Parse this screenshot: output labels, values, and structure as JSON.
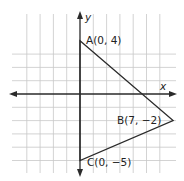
{
  "diagram": {
    "type": "coordinate-plane",
    "axes": {
      "x_label": "x",
      "y_label": "y"
    },
    "grid": {
      "x_min": -5,
      "x_max": 7,
      "y_min": -5,
      "y_max": 4
    },
    "points": [
      {
        "name": "A",
        "x": 0,
        "y": 4,
        "label": "A(0, 4)"
      },
      {
        "name": "B",
        "x": 7,
        "y": -2,
        "label": "B(7, −2)"
      },
      {
        "name": "C",
        "x": 0,
        "y": -5,
        "label": "C(0, −5)"
      }
    ],
    "polygon": [
      "A",
      "B",
      "C"
    ]
  }
}
